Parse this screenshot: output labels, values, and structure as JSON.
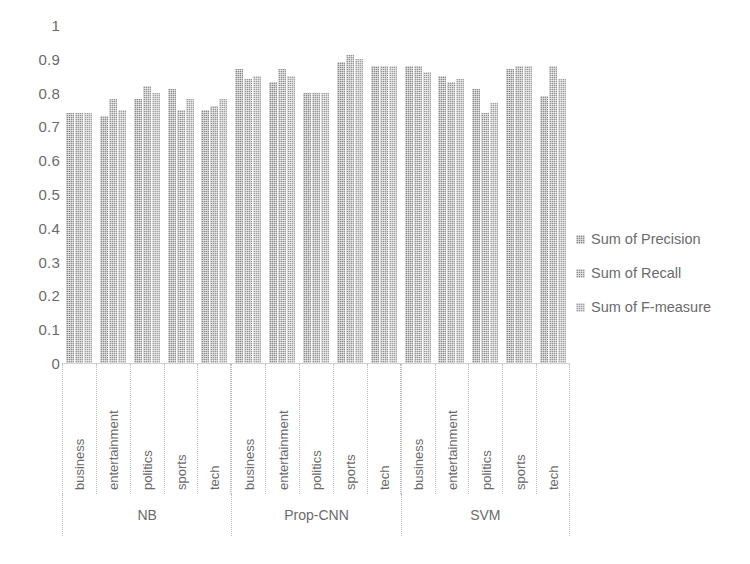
{
  "chart_data": {
    "type": "bar",
    "title": "",
    "subtitle": "",
    "xlabel": "",
    "ylabel": "",
    "ylim": [
      0,
      1
    ],
    "y_ticks": [
      "0",
      "0.1",
      "0.2",
      "0.3",
      "0.4",
      "0.5",
      "0.6",
      "0.7",
      "0.8",
      "0.9",
      "1"
    ],
    "grid": false,
    "legend_position": "right",
    "categories": [
      "business",
      "entertainment",
      "politics",
      "sports",
      "tech"
    ],
    "groups": [
      "NB",
      "Prop-CNN",
      "SVM"
    ],
    "series": [
      {
        "name": "Sum of Precision",
        "color": "#8d8d8d",
        "values_by_group": {
          "NB": [
            0.74,
            0.73,
            0.78,
            0.81,
            0.75
          ],
          "Prop-CNN": [
            0.87,
            0.83,
            0.8,
            0.89,
            0.88
          ],
          "SVM": [
            0.88,
            0.85,
            0.81,
            0.87,
            0.79
          ]
        }
      },
      {
        "name": "Sum of Recall",
        "color": "#969696",
        "values_by_group": {
          "NB": [
            0.74,
            0.78,
            0.82,
            0.75,
            0.76
          ],
          "Prop-CNN": [
            0.84,
            0.87,
            0.8,
            0.91,
            0.88
          ],
          "SVM": [
            0.88,
            0.83,
            0.74,
            0.88,
            0.88
          ]
        }
      },
      {
        "name": "Sum of F-measure",
        "color": "#a2a2a2",
        "values_by_group": {
          "NB": [
            0.74,
            0.75,
            0.8,
            0.78,
            0.78
          ],
          "Prop-CNN": [
            0.85,
            0.85,
            0.8,
            0.9,
            0.88
          ],
          "SVM": [
            0.86,
            0.84,
            0.77,
            0.88,
            0.84
          ]
        }
      }
    ]
  },
  "legend": {
    "items": [
      {
        "label": "Sum of Precision"
      },
      {
        "label": "Sum of Recall"
      },
      {
        "label": "Sum of F-measure"
      }
    ]
  },
  "caption": {
    "text": ""
  }
}
